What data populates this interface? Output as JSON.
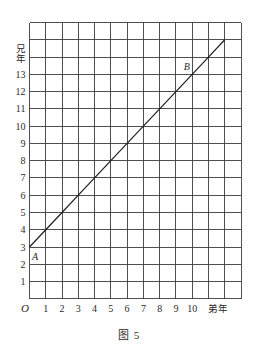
{
  "figure": {
    "caption": "图 5"
  },
  "chart_data": {
    "type": "line",
    "title": "",
    "xlabel": "弟年",
    "ylabel": "兄年",
    "origin_label": "O",
    "xlim": [
      0,
      13
    ],
    "ylim": [
      0,
      16
    ],
    "grid": true,
    "legend": "none",
    "x_ticks": [
      "1",
      "2",
      "3",
      "4",
      "5",
      "6",
      "7",
      "8",
      "9",
      "10"
    ],
    "y_ticks": [
      "1",
      "2",
      "3",
      "4",
      "5",
      "6",
      "7",
      "8",
      "9",
      "10",
      "11",
      "12",
      "13"
    ],
    "series": [
      {
        "x": [
          0,
          1,
          2,
          3,
          4,
          5,
          6,
          7,
          8,
          9,
          10,
          11,
          12
        ],
        "y": [
          3,
          4,
          5,
          6,
          7,
          8,
          9,
          10,
          11,
          12,
          13,
          14,
          15
        ]
      }
    ],
    "points": [
      {
        "label": "A",
        "x": 0,
        "y": 3
      },
      {
        "label": "B",
        "x": 10,
        "y": 13
      }
    ],
    "colors": {
      "grid": "#3c3c3c",
      "line": "#1e1e1e",
      "text": "#2a2a2a"
    }
  }
}
